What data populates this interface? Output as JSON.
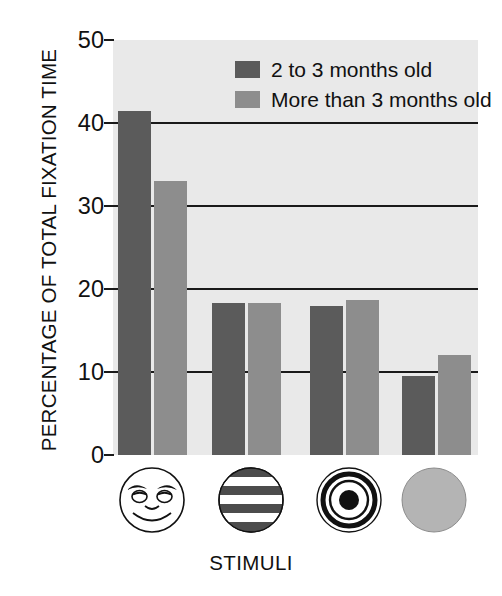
{
  "chart_data": {
    "type": "bar",
    "title": "",
    "xlabel": "STIMULI",
    "ylabel": "PERCENTAGE OF TOTAL FIXATION TIME",
    "ylim": [
      0,
      50
    ],
    "yticks": [
      0,
      10,
      20,
      30,
      40,
      50
    ],
    "gridlines": [
      10,
      20,
      30,
      40
    ],
    "grid": true,
    "legend_position": "top-center",
    "categories": [
      "face",
      "stripes",
      "bullseye",
      "plain disk"
    ],
    "series": [
      {
        "name": "2 to 3 months old",
        "color": "#5b5b5b",
        "values": [
          41.5,
          18.3,
          18.0,
          9.5
        ]
      },
      {
        "name": "More than 3 months old",
        "color": "#8d8d8d",
        "values": [
          33.0,
          18.3,
          18.7,
          12.0
        ]
      }
    ]
  },
  "axis": {
    "y_title": "PERCENTAGE OF TOTAL FIXATION TIME",
    "x_title": "STIMULI",
    "y_tick_labels": [
      "50",
      "40",
      "30",
      "20",
      "10",
      "0"
    ]
  },
  "legend": {
    "items": [
      {
        "label": "2 to 3 months old",
        "swatch": "dark-gray-swatch"
      },
      {
        "label": "More than 3 months old",
        "swatch": "medium-gray-swatch"
      }
    ]
  },
  "stimuli": [
    {
      "name": "schematic-face-icon",
      "description": "face"
    },
    {
      "name": "horizontal-stripes-icon",
      "description": "stripes"
    },
    {
      "name": "bullseye-icon",
      "description": "bullseye"
    },
    {
      "name": "plain-disk-icon",
      "description": "plain disk"
    }
  ],
  "colors": {
    "bar_dark": "#5b5b5b",
    "bar_light": "#8d8d8d",
    "plot_background": "#e9e9e9",
    "gridline": "#1a1a1a",
    "text": "#111111",
    "page_background": "#ffffff"
  }
}
